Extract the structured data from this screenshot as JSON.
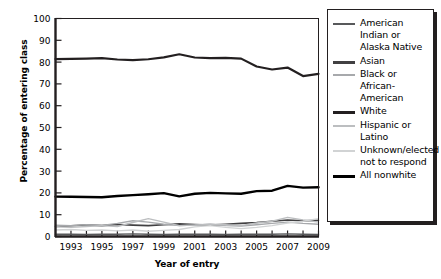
{
  "chart_data": {
    "type": "line",
    "title": "",
    "xlabel": "Year of entry",
    "ylabel": "Percentage of entering class",
    "xlim": [
      1992,
      2009
    ],
    "ylim": [
      0,
      100
    ],
    "ytick_step": 10,
    "yticks": [
      0,
      10,
      20,
      30,
      40,
      50,
      60,
      70,
      80,
      90,
      100
    ],
    "x": [
      1992,
      1993,
      1994,
      1995,
      1996,
      1997,
      1998,
      1999,
      2000,
      2001,
      2002,
      2003,
      2004,
      2005,
      2006,
      2007,
      2008,
      2009
    ],
    "xtick_labels": [
      "1993",
      "1995",
      "1997",
      "1999",
      "2001",
      "2003",
      "2005",
      "2007",
      "2009"
    ],
    "xtick_label_years": [
      1993,
      1995,
      1997,
      1999,
      2001,
      2003,
      2005,
      2007,
      2009
    ],
    "grid": false,
    "legend_position": "right-outside",
    "series": [
      {
        "name": "American Indian or Alaska Native",
        "color": "#58595b",
        "width": 1.4,
        "values": [
          1.0,
          1.0,
          0.9,
          1.1,
          1.0,
          1.2,
          1.0,
          0.9,
          1.0,
          1.1,
          1.0,
          0.9,
          1.0,
          1.1,
          1.0,
          1.2,
          1.0,
          0.9
        ]
      },
      {
        "name": "Asian",
        "color": "#414042",
        "width": 1.6,
        "values": [
          4.6,
          4.9,
          5.3,
          5.0,
          5.5,
          5.2,
          5.0,
          5.4,
          5.8,
          5.5,
          5.2,
          5.6,
          6.0,
          6.4,
          7.0,
          7.6,
          7.2,
          7.4
        ]
      },
      {
        "name": "Black or African-American",
        "color": "#a7a9ac",
        "width": 1.4,
        "values": [
          5.2,
          5.0,
          5.4,
          5.1,
          6.0,
          7.2,
          6.6,
          5.6,
          5.0,
          5.3,
          5.6,
          5.0,
          4.8,
          5.4,
          6.0,
          6.6,
          6.0,
          5.6
        ]
      },
      {
        "name": "White",
        "color": "#231f20",
        "width": 2.2,
        "values": [
          81.4,
          81.5,
          81.6,
          81.8,
          81.2,
          80.9,
          81.3,
          82.2,
          83.6,
          82.1,
          81.8,
          81.9,
          81.6,
          78.0,
          76.6,
          77.5,
          73.6,
          74.6
        ]
      },
      {
        "name": "Hispanic or Latino",
        "color": "#bcbec0",
        "width": 1.4,
        "values": [
          4.5,
          4.2,
          4.6,
          5.0,
          4.6,
          6.4,
          8.2,
          6.6,
          5.0,
          5.2,
          5.6,
          5.4,
          5.0,
          6.2,
          7.0,
          8.8,
          7.6,
          6.6
        ]
      },
      {
        "name": "Unknown/elected not to respond",
        "color": "#d1d3d4",
        "width": 1.4,
        "values": [
          3.0,
          3.2,
          2.8,
          3.0,
          2.6,
          3.0,
          2.4,
          2.8,
          3.2,
          4.4,
          5.0,
          4.2,
          3.6,
          4.2,
          5.0,
          6.2,
          7.0,
          8.2
        ]
      },
      {
        "name": "All nonwhite",
        "color": "#000000",
        "width": 2.4,
        "values": [
          18.3,
          18.2,
          18.1,
          18.0,
          18.6,
          19.0,
          19.4,
          19.9,
          18.4,
          19.6,
          20.0,
          19.8,
          19.6,
          20.8,
          21.0,
          23.2,
          22.4,
          22.6
        ]
      }
    ]
  },
  "legend": {
    "items": [
      {
        "label": "American Indian or Alaska Native",
        "color": "#58595b",
        "thickness": 2
      },
      {
        "label": "Asian",
        "color": "#414042",
        "thickness": 3
      },
      {
        "label": "Black or African-American",
        "color": "#a7a9ac",
        "thickness": 2
      },
      {
        "label": "White",
        "color": "#231f20",
        "thickness": 3
      },
      {
        "label": "Hispanic or Latino",
        "color": "#bcbec0",
        "thickness": 2
      },
      {
        "label": "Unknown/elected not to respond",
        "color": "#d1d3d4",
        "thickness": 2
      },
      {
        "label": "All nonwhite",
        "color": "#000000",
        "thickness": 3
      }
    ]
  }
}
